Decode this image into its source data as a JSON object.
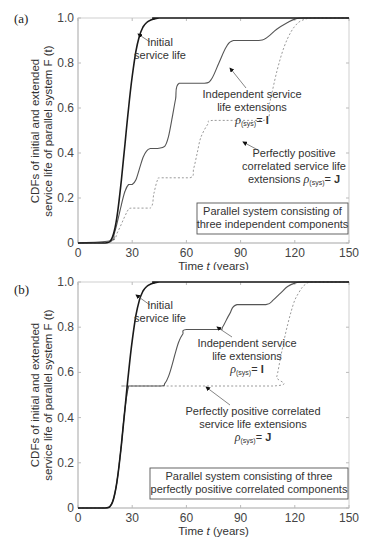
{
  "panels": [
    {
      "label": "(a)",
      "ylabel_line1": "CDFs of initial and extended",
      "ylabel_line2": "service life of parallel system F (t)",
      "xlabel": "Time t (years)",
      "yticks": [
        "0",
        "0.2",
        "0.4",
        "0.6",
        "0.8",
        "1.0"
      ],
      "xticks": [
        "0",
        "30",
        "60",
        "90",
        "120",
        "150"
      ],
      "annotations": {
        "initial": [
          "Initial",
          "service life"
        ],
        "independent": [
          "Independent service",
          "life extensions",
          "ρ(sys)= I"
        ],
        "correlated": [
          "Perfectly positive",
          "correlated service life",
          "extensions ρ(sys)= J"
        ]
      },
      "box": [
        "Parallel system consisting of",
        "three independent components"
      ]
    },
    {
      "label": "(b)",
      "ylabel_line1": "CDFs of initial and extended",
      "ylabel_line2": "service life of parallel system F (t)",
      "xlabel": "Time t (years)",
      "yticks": [
        "0",
        "0.2",
        "0.4",
        "0.6",
        "0.8",
        "1.0"
      ],
      "xticks": [
        "0",
        "30",
        "60",
        "90",
        "120",
        "150"
      ],
      "annotations": {
        "initial": [
          "Initial",
          "service life"
        ],
        "independent": [
          "Independent service",
          "life extensions",
          "ρ(sys)= I"
        ],
        "correlated": [
          "Perfectly positive correlated",
          "service life extensions",
          "ρ(sys)= J"
        ]
      },
      "box": [
        "Parallel system consisting of three",
        "perfectly positive correlated components"
      ]
    }
  ],
  "chart_data": [
    {
      "type": "line",
      "title": "(a) Parallel system consisting of three independent components",
      "xlabel": "Time t (years)",
      "ylabel": "CDFs of initial and extended service life of parallel system F(t)",
      "xlim": [
        0,
        150
      ],
      "ylim": [
        0,
        1.0
      ],
      "xticks": [
        0,
        30,
        60,
        90,
        120,
        150
      ],
      "yticks": [
        0,
        0.2,
        0.4,
        0.6,
        0.8,
        1.0
      ],
      "grid": false,
      "series": [
        {
          "name": "Initial service life",
          "style": "solid-dark",
          "x": [
            0,
            15,
            18,
            20,
            22,
            24,
            26,
            28,
            30,
            32,
            34,
            36,
            38,
            40,
            42,
            45,
            50,
            150
          ],
          "y": [
            0,
            0,
            0.01,
            0.05,
            0.14,
            0.28,
            0.44,
            0.6,
            0.74,
            0.85,
            0.92,
            0.96,
            0.98,
            0.99,
            0.995,
            1.0,
            1.0,
            1.0
          ]
        },
        {
          "name": "Independent service life extensions ρ(sys)= I",
          "style": "solid-gray",
          "x": [
            0,
            18,
            20,
            22,
            24,
            26,
            28,
            30,
            32,
            34,
            36,
            38,
            40,
            44,
            48,
            50,
            52,
            54,
            56,
            70,
            74,
            78,
            82,
            86,
            100,
            104,
            110,
            116,
            120,
            125,
            150
          ],
          "y": [
            0,
            0.01,
            0.04,
            0.1,
            0.17,
            0.23,
            0.26,
            0.26,
            0.28,
            0.33,
            0.38,
            0.41,
            0.42,
            0.42,
            0.43,
            0.47,
            0.55,
            0.64,
            0.71,
            0.71,
            0.73,
            0.8,
            0.87,
            0.9,
            0.9,
            0.91,
            0.95,
            0.98,
            0.995,
            1.0,
            1.0
          ]
        },
        {
          "name": "Perfectly positive correlated service life extensions ρ(sys)= J",
          "style": "dotted",
          "x": [
            0,
            18,
            22,
            26,
            28,
            30,
            40,
            42,
            44,
            46,
            62,
            64,
            66,
            68,
            72,
            75,
            103,
            106,
            110,
            114,
            118,
            122,
            126,
            130,
            150
          ],
          "y": [
            0,
            0.005,
            0.05,
            0.12,
            0.15,
            0.155,
            0.155,
            0.22,
            0.28,
            0.29,
            0.29,
            0.33,
            0.4,
            0.47,
            0.53,
            0.545,
            0.545,
            0.62,
            0.76,
            0.87,
            0.94,
            0.98,
            0.995,
            1.0,
            1.0
          ]
        }
      ]
    },
    {
      "type": "line",
      "title": "(b) Parallel system consisting of three perfectly positive correlated components",
      "xlabel": "Time t (years)",
      "ylabel": "CDFs of initial and extended service life of parallel system F(t)",
      "xlim": [
        0,
        150
      ],
      "ylim": [
        0,
        1.0
      ],
      "xticks": [
        0,
        30,
        60,
        90,
        120,
        150
      ],
      "yticks": [
        0,
        0.2,
        0.4,
        0.6,
        0.8,
        1.0
      ],
      "grid": false,
      "series": [
        {
          "name": "Initial service life",
          "style": "solid-dark",
          "x": [
            0,
            15,
            18,
            20,
            22,
            24,
            26,
            28,
            30,
            32,
            34,
            36,
            38,
            40,
            42,
            45,
            50,
            150
          ],
          "y": [
            0,
            0,
            0.01,
            0.05,
            0.14,
            0.28,
            0.44,
            0.6,
            0.74,
            0.85,
            0.92,
            0.96,
            0.98,
            0.99,
            0.995,
            1.0,
            1.0,
            1.0
          ]
        },
        {
          "name": "Independent service life extensions ρ(sys)= I",
          "style": "solid-gray",
          "x": [
            0,
            15,
            18,
            20,
            22,
            24,
            26,
            28,
            29,
            30,
            46,
            48,
            50,
            52,
            54,
            56,
            58,
            60,
            78,
            80,
            84,
            88,
            104,
            108,
            112,
            116,
            120,
            125,
            150
          ],
          "y": [
            0,
            0,
            0.01,
            0.05,
            0.14,
            0.28,
            0.44,
            0.54,
            0.54,
            0.54,
            0.54,
            0.55,
            0.58,
            0.63,
            0.69,
            0.74,
            0.77,
            0.79,
            0.79,
            0.8,
            0.86,
            0.9,
            0.9,
            0.92,
            0.95,
            0.98,
            0.995,
            1.0,
            1.0
          ]
        },
        {
          "name": "Perfectly positive correlated service life extensions ρ(sys)= J",
          "style": "dotted",
          "x": [
            0,
            15,
            18,
            20,
            22,
            24,
            26,
            28,
            30,
            108,
            110,
            112,
            114,
            116,
            118,
            120,
            122,
            124,
            126,
            130,
            150
          ],
          "y": [
            0,
            0,
            0.01,
            0.05,
            0.14,
            0.28,
            0.44,
            0.54,
            0.54,
            0.54,
            0.58,
            0.66,
            0.74,
            0.81,
            0.87,
            0.92,
            0.95,
            0.975,
            0.99,
            1.0,
            1.0
          ]
        }
      ]
    }
  ]
}
